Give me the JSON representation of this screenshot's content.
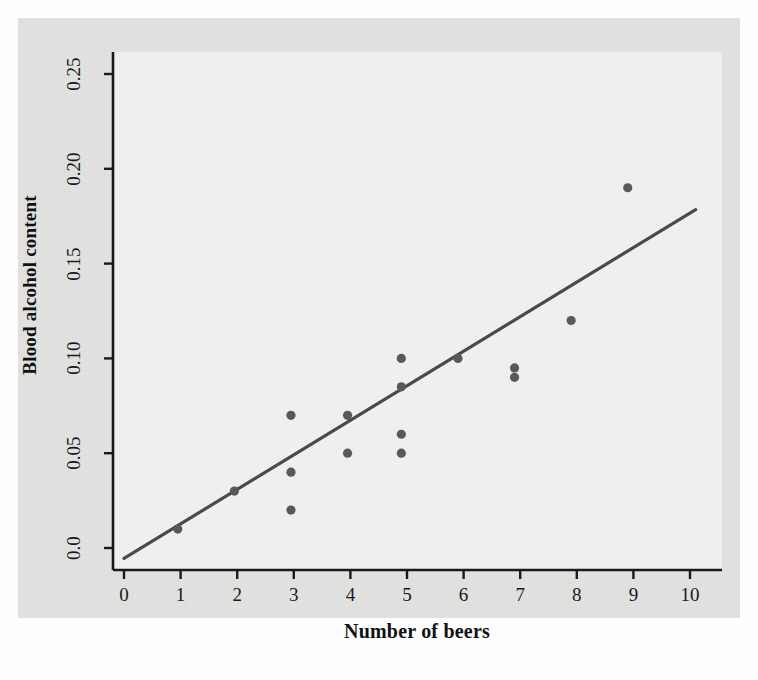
{
  "chart_data": {
    "type": "scatter",
    "title": "",
    "xlabel": "Number of beers",
    "ylabel": "Blood alcohol content",
    "xlim": [
      0,
      10.4
    ],
    "ylim": [
      -0.012,
      0.262
    ],
    "xticks": [
      "0",
      "1",
      "2",
      "3",
      "4",
      "5",
      "6",
      "7",
      "8",
      "9",
      "10"
    ],
    "xtick_values": [
      0,
      1,
      2,
      3,
      4,
      5,
      6,
      7,
      8,
      9,
      10
    ],
    "yticks": [
      "0.0",
      "0.05",
      "0.10",
      "0.15",
      "0.20",
      "0.25"
    ],
    "ytick_values": [
      0.0,
      0.05,
      0.1,
      0.15,
      0.2,
      0.25
    ],
    "grid": false,
    "legend": "none",
    "marker_color": "#595959",
    "line_color": "#4a4a4a",
    "panel_color": "#efefed",
    "points": [
      {
        "x": 0.95,
        "y": 0.01
      },
      {
        "x": 1.95,
        "y": 0.03
      },
      {
        "x": 2.95,
        "y": 0.07
      },
      {
        "x": 2.95,
        "y": 0.04
      },
      {
        "x": 2.95,
        "y": 0.02
      },
      {
        "x": 3.95,
        "y": 0.07
      },
      {
        "x": 3.95,
        "y": 0.05
      },
      {
        "x": 4.9,
        "y": 0.1
      },
      {
        "x": 4.9,
        "y": 0.085
      },
      {
        "x": 4.9,
        "y": 0.06
      },
      {
        "x": 4.9,
        "y": 0.05
      },
      {
        "x": 5.9,
        "y": 0.1
      },
      {
        "x": 6.9,
        "y": 0.095
      },
      {
        "x": 6.9,
        "y": 0.09
      },
      {
        "x": 7.9,
        "y": 0.12
      },
      {
        "x": 8.9,
        "y": 0.19
      }
    ],
    "trendline": {
      "x0": 0.0,
      "y0": -0.0055,
      "x1": 10.1,
      "y1": 0.1785,
      "slope": 0.0182,
      "intercept": -0.0055
    }
  },
  "axes": {
    "x_title": "Number of beers",
    "y_title": "Blood alcohol content"
  }
}
